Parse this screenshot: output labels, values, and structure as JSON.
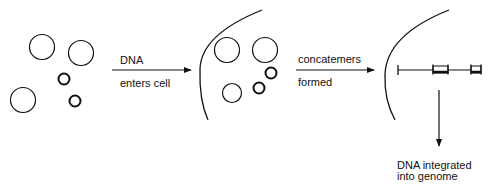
{
  "diagram": {
    "colors": {
      "stroke": "#111111",
      "background": "#ffffff"
    },
    "steps": [
      {
        "id": "step1",
        "label_top": "DNA",
        "label_bottom": "enters cell"
      },
      {
        "id": "step2",
        "label_top": "concatemers",
        "label_bottom": "formed"
      }
    ],
    "result": {
      "line1": "DNA integrated",
      "line2": "into genome"
    },
    "panels": [
      {
        "name": "extracellular-dna",
        "items": [
          "plasmid-circle-large",
          "plasmid-circle-large",
          "plasmid-circle-small",
          "plasmid-circle-large",
          "plasmid-circle-small"
        ]
      },
      {
        "name": "dna-inside-cell",
        "items": [
          "cell-membrane-arc",
          "plasmid-circle-large",
          "plasmid-circle-large",
          "plasmid-circle-small",
          "plasmid-circle-small",
          "plasmid-circle-large"
        ]
      },
      {
        "name": "concatemer-in-cell",
        "items": [
          "cell-membrane-arc",
          "concatemer-line",
          "insert-block",
          "insert-block"
        ]
      }
    ]
  }
}
